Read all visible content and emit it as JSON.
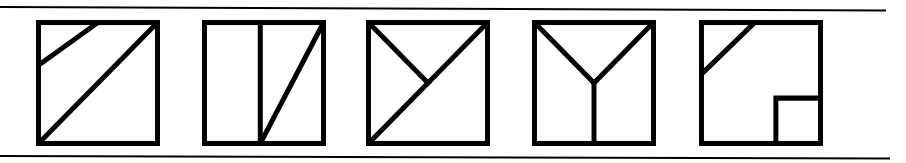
{
  "page": {
    "kind": "geometric-figures-row",
    "background_color": "#ffffff",
    "ink_color": "#000000",
    "width": 906,
    "height": 163,
    "panel_count": 5
  },
  "rules": {
    "top": {
      "label": "horizontal rule top",
      "color": "#000000",
      "thickness": 2
    },
    "bottom": {
      "label": "horizontal rule bottom",
      "color": "#000000",
      "thickness": 2
    }
  },
  "panels": [
    {
      "index": 1,
      "label": "Figure 1",
      "description": "Square with a full diagonal from bottom-left to top-right and a shorter parallel diagonal in the upper-left region",
      "shape": "square",
      "line_count": 2,
      "lines": [
        {
          "name": "main-diagonal",
          "from": [
            0,
            100
          ],
          "to": [
            100,
            0
          ]
        },
        {
          "name": "short-parallel-diagonal",
          "from": [
            0,
            36
          ],
          "to": [
            50,
            0
          ]
        }
      ],
      "sub_square": null
    },
    {
      "index": 2,
      "label": "Figure 2",
      "description": "Square with a vertical divider at 47% width and a diagonal from the divider's base to the top-right corner",
      "shape": "square",
      "line_count": 2,
      "lines": [
        {
          "name": "vertical-divider",
          "from": [
            47,
            0
          ],
          "to": [
            47,
            100
          ]
        },
        {
          "name": "diagonal-to-top-right",
          "from": [
            47,
            100
          ],
          "to": [
            100,
            0
          ]
        }
      ],
      "sub_square": null
    },
    {
      "index": 3,
      "label": "Figure 3",
      "description": "Square with a full diagonal from bottom-left to top-right and a line from the top-left corner meeting it at the centre",
      "shape": "square",
      "line_count": 2,
      "lines": [
        {
          "name": "main-diagonal",
          "from": [
            0,
            100
          ],
          "to": [
            100,
            0
          ]
        },
        {
          "name": "half-diagonal-from-top-left",
          "from": [
            0,
            0
          ],
          "to": [
            50,
            50
          ]
        }
      ],
      "sub_square": null
    },
    {
      "index": 4,
      "label": "Figure 4",
      "description": "Square containing a Y shape: lines from both top corners meet at the centre, then a vertical stem runs down to the bottom edge",
      "shape": "square",
      "line_count": 3,
      "lines": [
        {
          "name": "y-left-arm",
          "from": [
            0,
            0
          ],
          "to": [
            50,
            50
          ]
        },
        {
          "name": "y-right-arm",
          "from": [
            100,
            0
          ],
          "to": [
            50,
            50
          ]
        },
        {
          "name": "y-stem",
          "from": [
            50,
            50
          ],
          "to": [
            50,
            100
          ]
        }
      ],
      "sub_square": null
    },
    {
      "index": 5,
      "label": "Figure 5",
      "description": "Square with a diagonal across the upper-left corner and a small square inset in the bottom-right corner",
      "shape": "square",
      "line_count": 1,
      "lines": [
        {
          "name": "upper-left-diagonal",
          "from": [
            0,
            43
          ],
          "to": [
            45,
            0
          ]
        }
      ],
      "sub_square": {
        "name": "bottom-right-inset-square",
        "x": 62,
        "y": 62,
        "size": 38
      }
    }
  ]
}
